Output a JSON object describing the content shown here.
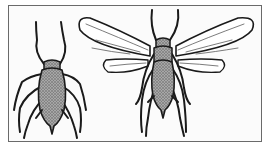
{
  "illustration": {
    "subject": "aphids",
    "figures": [
      {
        "name": "wingless-aphid",
        "description": "Wingless (apterous) aphid, dorsal view"
      },
      {
        "name": "winged-aphid",
        "description": "Winged (alate) aphid, dorsal view with wings spread"
      }
    ],
    "style": "black and white stippled line drawing",
    "colors": {
      "ink": "#1a1a1a",
      "body_shade": "#8c8c8c",
      "background": "#fbfbfb",
      "border": "#6a6a6a"
    }
  }
}
